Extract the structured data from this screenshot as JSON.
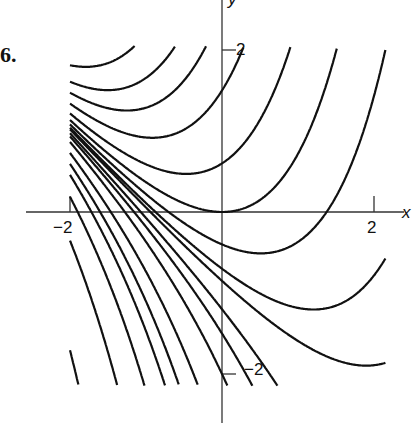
{
  "figure": {
    "label": "6."
  },
  "chart_data": {
    "type": "line",
    "title": "",
    "xlabel": "x",
    "ylabel": "y",
    "xlim": [
      -2.6,
      2.5
    ],
    "ylim": [
      -2.6,
      2.6
    ],
    "x_ticks": [
      {
        "value": -2,
        "label": "−2"
      },
      {
        "value": 2,
        "label": "2"
      }
    ],
    "y_ticks": [
      {
        "value": 2,
        "label": "2"
      },
      {
        "value": -2,
        "label": "−2"
      }
    ],
    "grid": false,
    "legend": null,
    "family": "y = C*exp(x) - x - 1",
    "series": [
      {
        "name": "C=60",
        "C": 60,
        "x_start": -2.0
      },
      {
        "name": "C=30",
        "C": 30,
        "x_start": -2.0
      },
      {
        "name": "C=10",
        "C": 10,
        "x_start": -2.0
      },
      {
        "name": "C=6",
        "C": 6,
        "x_start": -2.0
      },
      {
        "name": "C=4.5",
        "C": 4.5,
        "x_start": -2.0
      },
      {
        "name": "C=3.5",
        "C": 3.5,
        "x_start": -2.0
      },
      {
        "name": "C=2.5",
        "C": 2.5,
        "x_start": -2.0
      },
      {
        "name": "C=1.6",
        "C": 1.6,
        "x_start": -2.0
      },
      {
        "name": "C=1",
        "C": 1,
        "x_start": -2.0
      },
      {
        "name": "C=0.6",
        "C": 0.6,
        "x_start": -2.0
      },
      {
        "name": "C=0.3",
        "C": 0.3,
        "x_start": -2.0
      },
      {
        "name": "C=0.15",
        "C": 0.15,
        "x_start": -2.0
      },
      {
        "name": "C=-0.2",
        "C": -0.2,
        "x_start": -2.0
      },
      {
        "name": "C=-0.5",
        "C": -0.5,
        "x_start": -2.0
      },
      {
        "name": "C=-1",
        "C": -1,
        "x_start": -2.0
      },
      {
        "name": "C=-2",
        "C": -2,
        "x_start": -2.0
      },
      {
        "name": "C=-3",
        "C": -3,
        "x_start": -2.0
      },
      {
        "name": "C=-4",
        "C": -4,
        "x_start": -2.0
      },
      {
        "name": "C=-6",
        "C": -6,
        "x_start": -2.0
      },
      {
        "name": "C=-10",
        "C": -10,
        "x_start": -2.0
      },
      {
        "name": "C=-20",
        "C": -20,
        "x_start": -2.0
      },
      {
        "name": "C=-40",
        "C": -40,
        "x_start": -2.0
      },
      {
        "name": "C=-100",
        "C": -100,
        "x_start": -2.0
      }
    ]
  }
}
